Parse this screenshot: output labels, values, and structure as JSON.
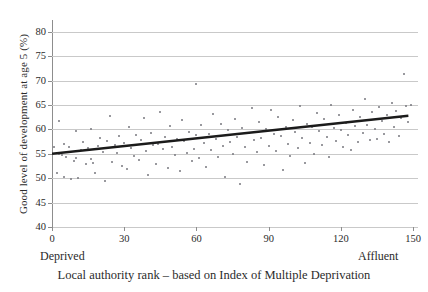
{
  "chart_data": {
    "type": "scatter",
    "title": "",
    "xlabel": "Local authority rank – based on Index of Multiple Deprivation",
    "ylabel": "Good level of development at age 5 (%)",
    "xlim": [
      0,
      152
    ],
    "ylim": [
      40,
      81
    ],
    "grid": true,
    "legend_position": "none",
    "xticks": [
      0,
      30,
      60,
      90,
      120,
      150
    ],
    "xtick_labels": [
      "0",
      "30",
      "60",
      "90",
      "120",
      "150"
    ],
    "yticks": [
      40,
      45,
      50,
      55,
      60,
      65,
      70,
      75,
      80
    ],
    "ytick_labels": [
      "40",
      "45",
      "50",
      "55",
      "60",
      "65",
      "70",
      "75",
      "80"
    ],
    "x_end_labels": {
      "left": "Deprived",
      "right": "Affluent"
    },
    "series": [
      {
        "name": "Local authorities",
        "marker": "dot",
        "color": "#77777e",
        "points": [
          [
            1,
            56.3
          ],
          [
            2,
            51.0
          ],
          [
            3,
            61.8
          ],
          [
            3,
            55.0
          ],
          [
            4,
            54.7
          ],
          [
            5,
            57.0
          ],
          [
            5,
            50.3
          ],
          [
            6,
            54.4
          ],
          [
            7,
            56.4
          ],
          [
            8,
            49.8
          ],
          [
            9,
            53.5
          ],
          [
            10,
            59.7
          ],
          [
            10,
            54.2
          ],
          [
            11,
            50.1
          ],
          [
            12,
            55.8
          ],
          [
            13,
            57.4
          ],
          [
            14,
            52.9
          ],
          [
            15,
            56.2
          ],
          [
            16,
            60.1
          ],
          [
            16,
            54.0
          ],
          [
            17,
            53.1
          ],
          [
            18,
            51.1
          ],
          [
            19,
            56.6
          ],
          [
            20,
            58.2
          ],
          [
            21,
            55.4
          ],
          [
            22,
            49.4
          ],
          [
            23,
            57.7
          ],
          [
            24,
            62.8
          ],
          [
            25,
            53.3
          ],
          [
            26,
            56.9
          ],
          [
            27,
            55.1
          ],
          [
            28,
            58.6
          ],
          [
            29,
            52.6
          ],
          [
            30,
            57.3
          ],
          [
            31,
            51.8
          ],
          [
            32,
            60.4
          ],
          [
            33,
            56.1
          ],
          [
            34,
            54.5
          ],
          [
            35,
            58.9
          ],
          [
            36,
            53.8
          ],
          [
            37,
            57.8
          ],
          [
            38,
            62.4
          ],
          [
            39,
            55.6
          ],
          [
            40,
            50.6
          ],
          [
            41,
            59.2
          ],
          [
            42,
            56.8
          ],
          [
            43,
            53.0
          ],
          [
            44,
            57.1
          ],
          [
            45,
            63.6
          ],
          [
            46,
            55.9
          ],
          [
            47,
            58.4
          ],
          [
            48,
            52.1
          ],
          [
            49,
            60.7
          ],
          [
            50,
            56.5
          ],
          [
            51,
            54.8
          ],
          [
            52,
            58.1
          ],
          [
            53,
            51.4
          ],
          [
            54,
            62.0
          ],
          [
            55,
            57.6
          ],
          [
            56,
            55.2
          ],
          [
            57,
            59.5
          ],
          [
            58,
            53.6
          ],
          [
            59,
            56.0
          ],
          [
            60,
            69.4
          ],
          [
            60,
            58.8
          ],
          [
            61,
            54.1
          ],
          [
            62,
            60.9
          ],
          [
            63,
            57.2
          ],
          [
            64,
            52.4
          ],
          [
            65,
            59.0
          ],
          [
            66,
            55.7
          ],
          [
            67,
            63.1
          ],
          [
            68,
            58.0
          ],
          [
            69,
            54.3
          ],
          [
            70,
            61.2
          ],
          [
            71,
            56.7
          ],
          [
            72,
            50.2
          ],
          [
            73,
            59.8
          ],
          [
            74,
            57.5
          ],
          [
            75,
            54.9
          ],
          [
            76,
            62.2
          ],
          [
            77,
            58.5
          ],
          [
            78,
            48.9
          ],
          [
            79,
            60.2
          ],
          [
            80,
            56.3
          ],
          [
            81,
            53.4
          ],
          [
            82,
            59.3
          ],
          [
            83,
            64.3
          ],
          [
            84,
            57.9
          ],
          [
            85,
            55.3
          ],
          [
            86,
            61.6
          ],
          [
            87,
            58.3
          ],
          [
            88,
            52.8
          ],
          [
            89,
            60.0
          ],
          [
            90,
            56.6
          ],
          [
            91,
            63.9
          ],
          [
            92,
            59.1
          ],
          [
            93,
            55.5
          ],
          [
            94,
            62.6
          ],
          [
            95,
            58.7
          ],
          [
            96,
            51.6
          ],
          [
            97,
            60.5
          ],
          [
            98,
            57.0
          ],
          [
            99,
            54.6
          ],
          [
            100,
            61.9
          ],
          [
            101,
            59.4
          ],
          [
            102,
            56.2
          ],
          [
            103,
            64.8
          ],
          [
            104,
            58.2
          ],
          [
            105,
            53.2
          ],
          [
            106,
            61.1
          ],
          [
            107,
            57.3
          ],
          [
            108,
            60.6
          ],
          [
            109,
            55.0
          ],
          [
            110,
            63.3
          ],
          [
            111,
            59.6
          ],
          [
            112,
            56.9
          ],
          [
            113,
            62.1
          ],
          [
            114,
            58.4
          ],
          [
            115,
            54.4
          ],
          [
            116,
            65.1
          ],
          [
            117,
            60.3
          ],
          [
            118,
            57.7
          ],
          [
            119,
            63.0
          ],
          [
            120,
            59.9
          ],
          [
            121,
            56.4
          ],
          [
            122,
            61.4
          ],
          [
            123,
            58.8
          ],
          [
            124,
            55.8
          ],
          [
            125,
            64.0
          ],
          [
            126,
            60.8
          ],
          [
            127,
            57.4
          ],
          [
            128,
            62.5
          ],
          [
            129,
            59.2
          ],
          [
            130,
            66.2
          ],
          [
            131,
            61.0
          ],
          [
            132,
            57.9
          ],
          [
            133,
            63.5
          ],
          [
            134,
            60.1
          ],
          [
            135,
            58.0
          ],
          [
            136,
            64.6
          ],
          [
            137,
            61.7
          ],
          [
            138,
            59.0
          ],
          [
            139,
            62.9
          ],
          [
            140,
            57.5
          ],
          [
            141,
            65.4
          ],
          [
            142,
            60.4
          ],
          [
            143,
            63.8
          ],
          [
            144,
            58.6
          ],
          [
            145,
            62.3
          ],
          [
            146,
            71.3
          ],
          [
            147,
            64.9
          ],
          [
            148,
            61.5
          ],
          [
            149,
            65.0
          ]
        ]
      }
    ],
    "trendline": {
      "name": "Linear fit",
      "color": "#1b1b1b",
      "x_start": 0,
      "y_start": 55.0,
      "x_end": 148,
      "y_end": 62.8
    }
  }
}
